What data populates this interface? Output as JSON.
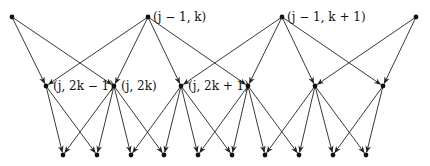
{
  "diagram": {
    "type": "wavelet-tree",
    "colors": {
      "edge": "#222222",
      "node": "#111111",
      "background": "#ffffff"
    },
    "levels": {
      "top": [
        {
          "id": "t0",
          "x": 12,
          "y": 17
        },
        {
          "id": "t1",
          "x": 148,
          "y": 17,
          "label": "(j − 1, k)"
        },
        {
          "id": "t2",
          "x": 282,
          "y": 17,
          "label": "(j − 1, k + 1)"
        },
        {
          "id": "t3",
          "x": 416,
          "y": 17
        }
      ],
      "middle": [
        {
          "id": "m0",
          "x": 46,
          "y": 86,
          "label": "(j, 2k − 1)"
        },
        {
          "id": "m1",
          "x": 114,
          "y": 86,
          "label": "(j, 2k)"
        },
        {
          "id": "m2",
          "x": 181,
          "y": 86,
          "label": "(j, 2k + 1)"
        },
        {
          "id": "m3",
          "x": 248,
          "y": 86
        },
        {
          "id": "m4",
          "x": 315,
          "y": 86
        },
        {
          "id": "m5",
          "x": 383,
          "y": 86
        }
      ],
      "bottom": [
        {
          "id": "b0",
          "x": 63,
          "y": 155
        },
        {
          "id": "b1",
          "x": 97,
          "y": 155
        },
        {
          "id": "b2",
          "x": 131,
          "y": 155
        },
        {
          "id": "b3",
          "x": 164,
          "y": 155
        },
        {
          "id": "b4",
          "x": 198,
          "y": 155
        },
        {
          "id": "b5",
          "x": 232,
          "y": 155
        },
        {
          "id": "b6",
          "x": 265,
          "y": 155
        },
        {
          "id": "b7",
          "x": 299,
          "y": 155
        },
        {
          "id": "b8",
          "x": 333,
          "y": 155
        },
        {
          "id": "b9",
          "x": 366,
          "y": 155
        }
      ]
    },
    "edges": [
      [
        "t0",
        "m0"
      ],
      [
        "t0",
        "m1"
      ],
      [
        "t1",
        "m0"
      ],
      [
        "t1",
        "m1"
      ],
      [
        "t1",
        "m2"
      ],
      [
        "t1",
        "m3"
      ],
      [
        "t2",
        "m2"
      ],
      [
        "t2",
        "m3"
      ],
      [
        "t2",
        "m4"
      ],
      [
        "t2",
        "m5"
      ],
      [
        "t3",
        "m4"
      ],
      [
        "t3",
        "m5"
      ],
      [
        "m0",
        "b0"
      ],
      [
        "m0",
        "b1"
      ],
      [
        "m1",
        "b0"
      ],
      [
        "m1",
        "b1"
      ],
      [
        "m1",
        "b2"
      ],
      [
        "m1",
        "b3"
      ],
      [
        "m2",
        "b2"
      ],
      [
        "m2",
        "b3"
      ],
      [
        "m2",
        "b4"
      ],
      [
        "m2",
        "b5"
      ],
      [
        "m3",
        "b4"
      ],
      [
        "m3",
        "b5"
      ],
      [
        "m3",
        "b6"
      ],
      [
        "m3",
        "b7"
      ],
      [
        "m4",
        "b6"
      ],
      [
        "m4",
        "b7"
      ],
      [
        "m4",
        "b8"
      ],
      [
        "m4",
        "b9"
      ],
      [
        "m5",
        "b8"
      ],
      [
        "m5",
        "b9"
      ]
    ]
  },
  "labels": {
    "t1": "(j − 1, k)",
    "t2": "(j − 1, k + 1)",
    "m0": "(j, 2k − 1)",
    "m1": "(j, 2k)",
    "m2": "(j, 2k + 1)"
  }
}
